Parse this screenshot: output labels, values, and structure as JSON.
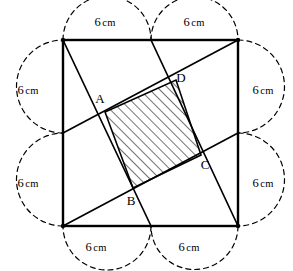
{
  "figure": {
    "shape": "square",
    "side_label": "6 cm",
    "unit": "cm",
    "half_side_value": "6",
    "colors": {
      "stroke": "#000000",
      "background": "#ffffff",
      "hatch": "#000000",
      "dashed_arc": "#000000"
    }
  },
  "dimension_labels": [
    {
      "id": "top-left",
      "value": "6",
      "unit": "cm",
      "x": 105,
      "y": 22
    },
    {
      "id": "top-right",
      "value": "6",
      "unit": "cm",
      "x": 194,
      "y": 22
    },
    {
      "id": "left-top",
      "value": "6",
      "unit": "cm",
      "x": 28,
      "y": 90
    },
    {
      "id": "left-bottom",
      "value": "6",
      "unit": "cm",
      "x": 28,
      "y": 183
    },
    {
      "id": "right-top",
      "value": "6",
      "unit": "cm",
      "x": 263,
      "y": 90
    },
    {
      "id": "right-bottom",
      "value": "6",
      "unit": "cm",
      "x": 263,
      "y": 183
    },
    {
      "id": "bottom-left",
      "value": "6",
      "unit": "cm",
      "x": 96,
      "y": 247
    },
    {
      "id": "bottom-right",
      "value": "6",
      "unit": "cm",
      "x": 189,
      "y": 247
    }
  ],
  "vertex_labels": [
    {
      "id": "A",
      "text": "A",
      "x": 100,
      "y": 99
    },
    {
      "id": "B",
      "text": "B",
      "x": 131,
      "y": 201
    },
    {
      "id": "C",
      "text": "C",
      "x": 205,
      "y": 165
    },
    {
      "id": "D",
      "text": "D",
      "x": 181,
      "y": 78
    }
  ],
  "geometry": {
    "square": {
      "left": 63,
      "top": 40,
      "right": 238,
      "bottom": 226
    },
    "midpoints": {
      "top": {
        "x": 151,
        "y": 40
      },
      "right": {
        "x": 238,
        "y": 133
      },
      "bottom": {
        "x": 151,
        "y": 226
      },
      "left": {
        "x": 63,
        "y": 133
      }
    },
    "cevians": [
      {
        "id": "topleft-to-bottommid",
        "x1": 63,
        "y1": 40,
        "x2": 151,
        "y2": 226
      },
      {
        "id": "topmid-to-bottomright",
        "x1": 151,
        "y1": 40,
        "x2": 238,
        "y2": 226
      },
      {
        "id": "leftmid-to-topright",
        "x1": 63,
        "y1": 133,
        "x2": 238,
        "y2": 40
      },
      {
        "id": "bottomleft-to-rightmid",
        "x1": 63,
        "y1": 226,
        "x2": 238,
        "y2": 133
      }
    ],
    "shaded_quad": {
      "points": "105,112 176,80 201,155 133,188",
      "vertices": [
        "A",
        "D",
        "C",
        "B"
      ]
    }
  }
}
